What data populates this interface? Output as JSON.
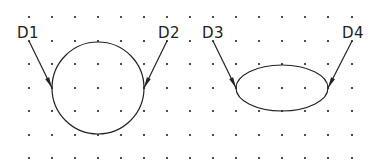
{
  "grid": {
    "xs": [
      29,
      52,
      75,
      98,
      121,
      144,
      167,
      190,
      213,
      236,
      259,
      282,
      305,
      328,
      352
    ],
    "ys": [
      17,
      41,
      64,
      88,
      111,
      135,
      158
    ],
    "dot_color": "#222222"
  },
  "shapes": {
    "circle": {
      "cx": 98,
      "cy": 88,
      "r": 46
    },
    "ellipse": {
      "cx": 282,
      "cy": 88,
      "rx": 46,
      "ry": 23
    }
  },
  "leaders": [
    {
      "label": "D1",
      "x1": 29,
      "y1": 41,
      "x2": 52,
      "y2": 88,
      "lx": 17,
      "ly": 26
    },
    {
      "label": "D2",
      "x1": 167,
      "y1": 41,
      "x2": 144,
      "y2": 88,
      "lx": 158,
      "ly": 26
    },
    {
      "label": "D3",
      "x1": 213,
      "y1": 41,
      "x2": 236,
      "y2": 88,
      "lx": 202,
      "ly": 26
    },
    {
      "label": "D4",
      "x1": 352,
      "y1": 41,
      "x2": 328,
      "y2": 88,
      "lx": 342,
      "ly": 26
    }
  ],
  "labels": {
    "d1": "D1",
    "d2": "D2",
    "d3": "D3",
    "d4": "D4"
  },
  "stroke_color": "#222222"
}
